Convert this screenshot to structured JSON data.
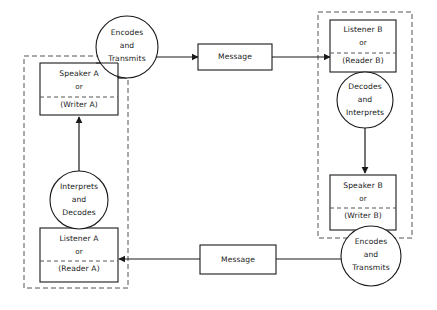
{
  "diagram": {
    "colors": {
      "stroke": "#1a1a1a",
      "dashed_group": "#555555",
      "background": "#ffffff",
      "text": "#1a1a1a"
    },
    "nodes": {
      "speaker_a": {
        "line1": "Speaker A",
        "line2": "or",
        "line3": "(Writer A)"
      },
      "listener_a": {
        "line1": "Listener A",
        "line2": "or",
        "line3": "(Reader A)"
      },
      "listener_b": {
        "line1": "Listener B",
        "line2": "or",
        "line3": "(Reader B)"
      },
      "speaker_b": {
        "line1": "Speaker B",
        "line2": "or",
        "line3": "(Writer B)"
      },
      "encodes_a": {
        "line1": "Encodes",
        "line2": "and",
        "line3": "Transmits"
      },
      "encodes_b": {
        "line1": "Encodes",
        "line2": "and",
        "line3": "Transmits"
      },
      "decodes_b": {
        "line1": "Decodes",
        "line2": "and",
        "line3": "Interprets"
      },
      "interprets_a": {
        "line1": "Interprets",
        "line2": "and",
        "line3": "Decodes"
      },
      "message_top": {
        "label": "Message"
      },
      "message_bottom": {
        "label": "Message"
      }
    }
  }
}
